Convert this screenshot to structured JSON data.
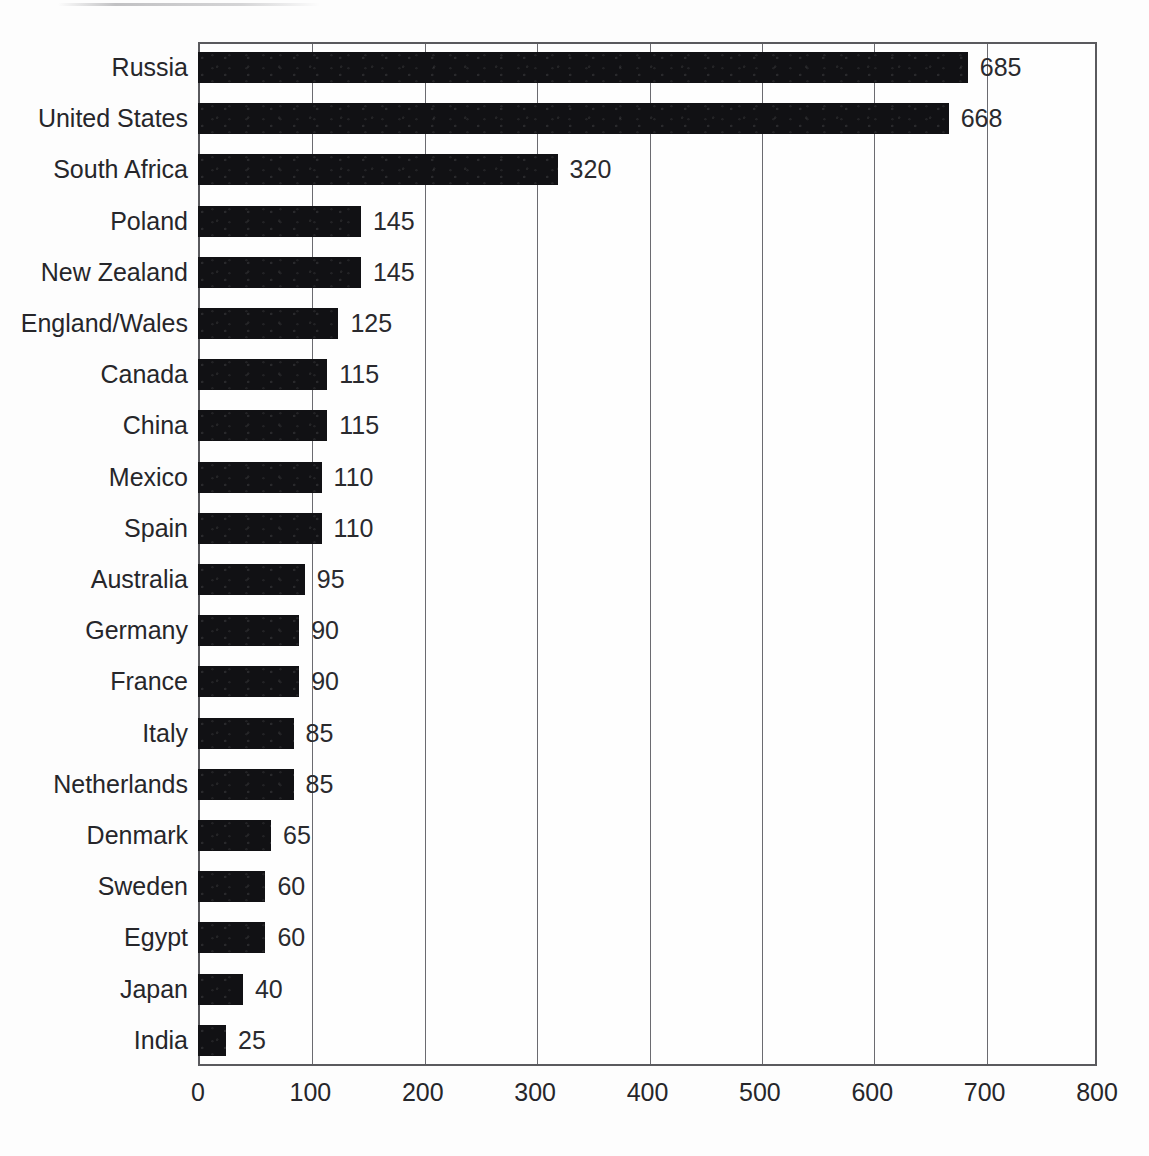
{
  "chart_data": {
    "type": "bar",
    "orientation": "horizontal",
    "title": "",
    "subtitle": "",
    "xlabel": "",
    "ylabel": "",
    "xlim": [
      0,
      800
    ],
    "xticks": [
      0,
      100,
      200,
      300,
      400,
      500,
      600,
      700,
      800
    ],
    "xtick_labels": [
      "0",
      "100",
      "200",
      "300",
      "400",
      "500",
      "600",
      "700",
      "800"
    ],
    "grid": true,
    "grid_axis": "x",
    "legend": null,
    "legend_position": "none",
    "bar_color": "#111114",
    "axis_color": "#5a5a5e",
    "background_color": "#fdfdfd",
    "value_labels_shown": true,
    "categories": [
      "Russia",
      "United States",
      "South Africa",
      "Poland",
      "New Zealand",
      "England/Wales",
      "Canada",
      "China",
      "Mexico",
      "Spain",
      "Australia",
      "Germany",
      "France",
      "Italy",
      "Netherlands",
      "Denmark",
      "Sweden",
      "Egypt",
      "Japan",
      "India"
    ],
    "values": [
      685,
      668,
      320,
      145,
      145,
      125,
      115,
      115,
      110,
      110,
      95,
      90,
      90,
      85,
      85,
      65,
      60,
      60,
      40,
      25
    ],
    "value_labels": [
      "685",
      "668",
      "320",
      "145",
      "145",
      "125",
      "115",
      "115",
      "110",
      "110",
      "95",
      "90",
      "90",
      "85",
      "85",
      "65",
      "60",
      "60",
      "40",
      "25"
    ]
  }
}
